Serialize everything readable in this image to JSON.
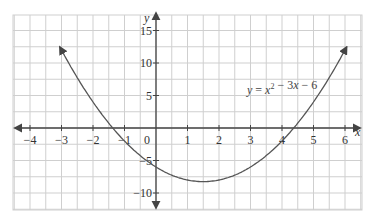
{
  "chart_data": {
    "type": "line",
    "title": "",
    "equation_label": "y = x² − 3x − 6",
    "equation": {
      "lhs": "y",
      "rhs_terms": [
        "x",
        "2",
        " − 3",
        "x",
        " − 6"
      ]
    },
    "xlabel": "x",
    "ylabel": "y",
    "xlim": [
      -4.5,
      6.6
    ],
    "ylim": [
      -12,
      18
    ],
    "grid": true,
    "x_ticks": [
      -4,
      -3,
      -2,
      -1,
      0,
      1,
      2,
      3,
      4,
      5,
      6
    ],
    "x_tick_labels": [
      "−4",
      "−3",
      "−2",
      "−1",
      "0",
      "1",
      "2",
      "3",
      "4",
      "5",
      "6"
    ],
    "y_ticks": [
      -10,
      -5,
      5,
      10,
      15
    ],
    "y_tick_labels": [
      "−10",
      "−5",
      "5",
      "10",
      "15"
    ],
    "series": [
      {
        "name": "y = x^2 - 3x - 6",
        "x": [
          -3.0,
          -2.5,
          -2.0,
          -1.5,
          -1.0,
          -0.5,
          0.0,
          0.5,
          1.0,
          1.5,
          2.0,
          2.5,
          3.0,
          3.5,
          4.0,
          4.5,
          5.0,
          5.5,
          6.0
        ],
        "values": [
          12.0,
          7.75,
          4.0,
          0.75,
          -2.0,
          -4.25,
          -6.0,
          -7.25,
          -8.0,
          -8.25,
          -8.0,
          -7.25,
          -6.0,
          -4.25,
          -2.0,
          0.75,
          4.0,
          7.75,
          12.0
        ]
      }
    ],
    "vertex": [
      1.5,
      -8.25
    ],
    "roots": [
      -1.37,
      4.37
    ],
    "y_intercept": -6
  },
  "colors": {
    "curve": "#555555",
    "axis": "#444444",
    "grid": "#cfcfcf",
    "background": "#ffffff"
  }
}
